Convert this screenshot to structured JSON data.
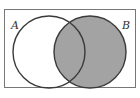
{
  "diagram": {
    "type": "venn",
    "universe": {
      "x": 4,
      "y": 9,
      "width": 132,
      "height": 79
    },
    "sets": [
      {
        "label": "A",
        "cx": 49,
        "cy": 52,
        "r": 36,
        "shaded": false
      },
      {
        "label": "B",
        "cx": 90,
        "cy": 52,
        "r": 36,
        "shaded": true
      }
    ],
    "shaded_region": "B",
    "colors": {
      "shade": "#a3a3a3",
      "stroke": "#3a3a3a",
      "border": "#777777"
    }
  }
}
